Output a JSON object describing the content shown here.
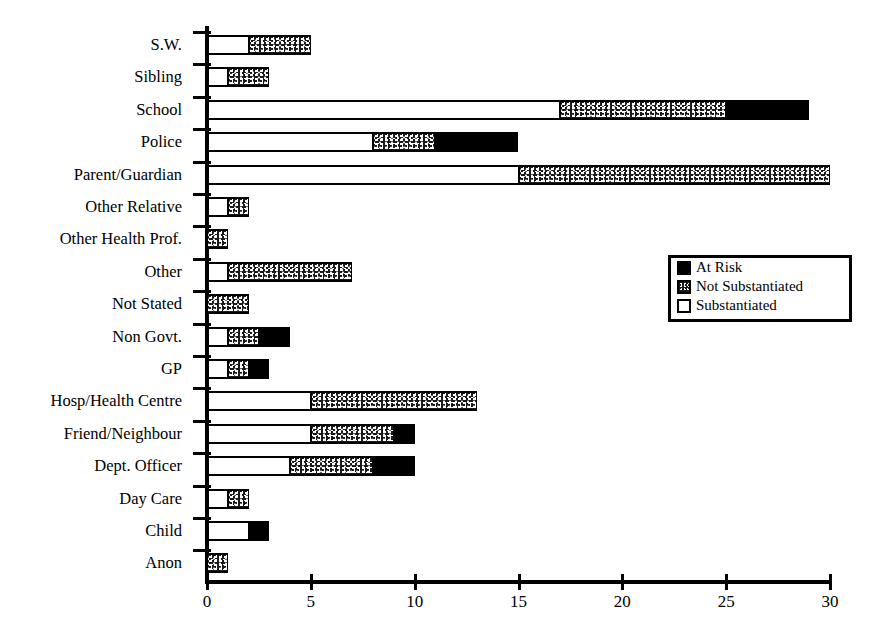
{
  "title_sliver": "report type by agency",
  "chart_data": {
    "type": "bar",
    "orientation": "horizontal",
    "stacked": true,
    "title": "",
    "xlabel": "",
    "ylabel": "",
    "xlim": [
      0,
      30
    ],
    "xticks": [
      0,
      5,
      10,
      15,
      20,
      25,
      30
    ],
    "xtick_labels": [
      "0",
      "5",
      "10",
      "15",
      "20",
      "25",
      "30"
    ],
    "grid": false,
    "legend_position": "middle-right",
    "categories": [
      "S.W.",
      "Sibling",
      "School",
      "Police",
      "Parent/Guardian",
      "Other Relative",
      "Other Health Prof.",
      "Other",
      "Not Stated",
      "Non Govt.",
      "GP",
      "Hosp/Health Centre",
      "Friend/Neighbour",
      "Dept. Officer",
      "Day Care",
      "Child",
      "Anon"
    ],
    "series": [
      {
        "name": "Substantiated",
        "fill": "white",
        "values": [
          2,
          1,
          17,
          8,
          15,
          1,
          0,
          1,
          0,
          1,
          1,
          5,
          5,
          4,
          1,
          2,
          0
        ]
      },
      {
        "name": "Not Substantiated",
        "fill": "stippled",
        "values": [
          3,
          2,
          8,
          3,
          15,
          1,
          1,
          6,
          2,
          1.5,
          1,
          8,
          4,
          4,
          1,
          0,
          1
        ]
      },
      {
        "name": "At Risk",
        "fill": "black",
        "values": [
          0,
          0,
          4,
          4,
          0,
          0,
          0,
          0,
          0,
          1.5,
          1,
          0,
          1,
          2,
          0,
          1,
          0
        ]
      }
    ],
    "totals": [
      5,
      3,
      29,
      15,
      30,
      2,
      1,
      7,
      2,
      4,
      3,
      13,
      10,
      10,
      2,
      3,
      1
    ]
  },
  "legend": {
    "items": [
      {
        "label": "At Risk",
        "swatch": "black-square-icon"
      },
      {
        "label": "Not Substantiated",
        "swatch": "stippled-square-icon"
      },
      {
        "label": "Substantiated",
        "swatch": "white-square-icon"
      }
    ]
  },
  "colors": {
    "at_risk": "#000000",
    "not_substantiated": "#1a1a1a",
    "substantiated": "#ffffff",
    "axis": "#000000"
  }
}
